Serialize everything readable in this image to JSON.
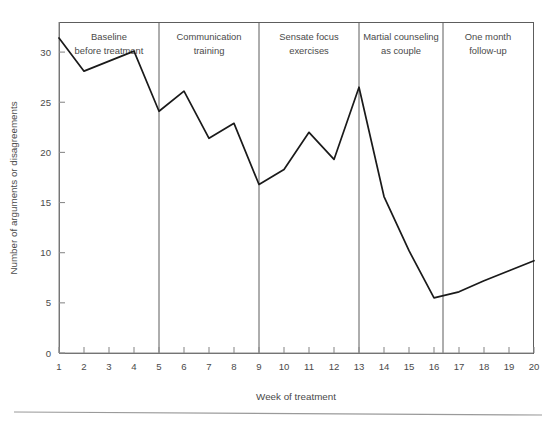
{
  "chart_data": {
    "type": "line",
    "title": "",
    "xlabel": "Week of treatment",
    "ylabel": "Number of arguments or disagreements",
    "x": [
      1,
      2,
      3,
      4,
      5,
      6,
      7,
      8,
      9,
      10,
      11,
      12,
      13,
      14,
      15,
      16,
      17,
      18,
      19,
      20
    ],
    "values": [
      31.4,
      28.1,
      29.1,
      30.1,
      24.1,
      26.1,
      21.4,
      22.9,
      16.8,
      18.3,
      22.0,
      19.3,
      26.5,
      15.6,
      10.2,
      5.5,
      6.1,
      7.2,
      8.2,
      9.2
    ],
    "xlim": [
      1,
      20
    ],
    "ylim": [
      0,
      33
    ],
    "yticks": [
      0,
      5,
      10,
      15,
      20,
      25,
      30
    ],
    "ytick_labels": [
      "0",
      "5",
      "10",
      "15",
      "20",
      "25",
      "30"
    ],
    "xticks": [
      1,
      2,
      3,
      4,
      5,
      6,
      7,
      8,
      9,
      10,
      11,
      12,
      13,
      14,
      15,
      16,
      17,
      18,
      19,
      20
    ],
    "xtick_labels": [
      "1",
      "2",
      "3",
      "4",
      "5",
      "6",
      "7",
      "8",
      "9",
      "10",
      "11",
      "12",
      "13",
      "14",
      "15",
      "16",
      "17",
      "18",
      "19",
      "20"
    ],
    "grid": false,
    "legend": "none",
    "line_color": "#1a1a1a",
    "phases": [
      {
        "label_line1": "Baseline",
        "label_line2": "before treatment",
        "start_week": 1,
        "end_week": 5
      },
      {
        "label_line1": "Communication",
        "label_line2": "training",
        "start_week": 5,
        "end_week": 9
      },
      {
        "label_line1": "Sensate focus",
        "label_line2": "exercises",
        "start_week": 9,
        "end_week": 13
      },
      {
        "label_line1": "Martial counseling",
        "label_line2": "as couple",
        "start_week": 13,
        "end_week": 17
      },
      {
        "label_line1": "One month",
        "label_line2": "follow-up",
        "start_week": 17,
        "end_week": 20
      }
    ],
    "dividers": [
      5,
      9,
      13,
      17
    ]
  },
  "figure": {
    "background": "#ffffff",
    "axis_color": "#8c8c8c",
    "frame_color": "#5d5d5d",
    "text_color": "#4a4a4a"
  }
}
